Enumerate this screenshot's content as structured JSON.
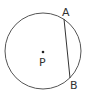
{
  "diagram": {
    "type": "circle-with-chord",
    "circle": {
      "cx": 43,
      "cy": 51,
      "r": 38,
      "stroke": "#555555"
    },
    "center_point": {
      "label": "P",
      "x": 43,
      "y": 52
    },
    "chord": {
      "from": {
        "label": "A",
        "x": 64,
        "y": 19
      },
      "to": {
        "label": "B",
        "x": 70,
        "y": 78
      },
      "stroke": "#333333"
    },
    "labels": {
      "A": "A",
      "B": "B",
      "P": "P"
    }
  }
}
